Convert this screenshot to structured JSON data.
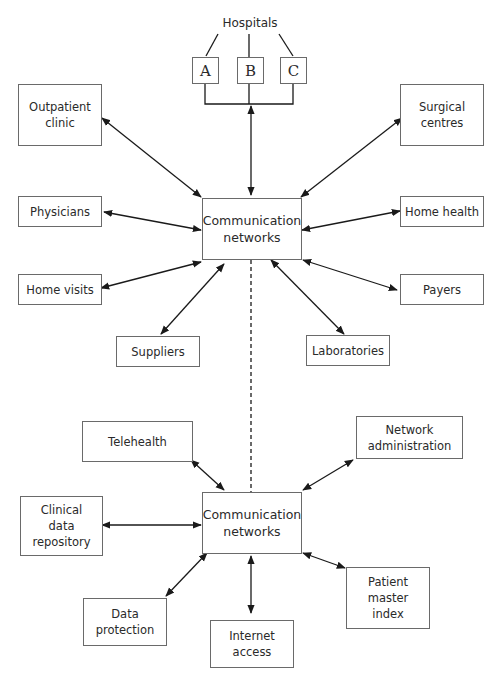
{
  "diagram": {
    "hospitals_label": "Hospitals",
    "hospitals": [
      "A",
      "B",
      "C"
    ],
    "top_hub": "Communication\nnetworks",
    "bottom_hub": "Communication\nnetworks",
    "top_nodes": {
      "outpatient": "Outpatient\nclinic",
      "surgical": "Surgical\ncentres",
      "physicians": "Physicians",
      "home_health": "Home health",
      "home_visits": "Home visits",
      "payers": "Payers",
      "suppliers": "Suppliers",
      "laboratories": "Laboratories"
    },
    "bottom_nodes": {
      "telehealth": "Telehealth",
      "network_admin": "Network\nadministration",
      "clinical_data": "Clinical\ndata\nrepository",
      "data_protection": "Data\nprotection",
      "internet_access": "Internet\naccess",
      "patient_index": "Patient\nmaster\nindex"
    },
    "connector_between_hubs": "dashed",
    "colors": {
      "line": "#1a1a1a",
      "box_border": "#6a6a6a",
      "text": "#2a2a2a"
    }
  }
}
